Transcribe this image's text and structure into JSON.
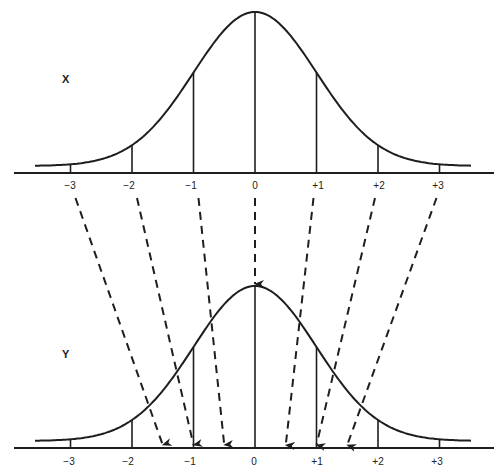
{
  "diagram": {
    "colors": {
      "ink": "#1e1e1e",
      "background": "#ffffff"
    },
    "top_panel": {
      "variable_label": "X",
      "axis_ticks": [
        {
          "value": -3,
          "label": "−3"
        },
        {
          "value": -2,
          "label": "−2"
        },
        {
          "value": -1,
          "label": "−1"
        },
        {
          "value": 0,
          "label": "0"
        },
        {
          "value": 1,
          "label": "+1"
        },
        {
          "value": 2,
          "label": "+2"
        },
        {
          "value": 3,
          "label": "+3"
        }
      ]
    },
    "bottom_panel": {
      "variable_label": "Y",
      "axis_ticks": [
        {
          "value": -3,
          "label": "−3"
        },
        {
          "value": -2,
          "label": "−2"
        },
        {
          "value": -1,
          "label": "−1"
        },
        {
          "value": 0,
          "label": "0"
        },
        {
          "value": 1,
          "label": "+1"
        },
        {
          "value": 2,
          "label": "+2"
        },
        {
          "value": 3,
          "label": "+3"
        }
      ]
    },
    "mappings": [
      {
        "from": -3,
        "to": -1.5
      },
      {
        "from": -2,
        "to": -1
      },
      {
        "from": -1,
        "to": -0.5
      },
      {
        "from": 0,
        "to": 0
      },
      {
        "from": 1,
        "to": 0.5
      },
      {
        "from": 2,
        "to": 1
      },
      {
        "from": 3,
        "to": 1.5
      }
    ]
  }
}
